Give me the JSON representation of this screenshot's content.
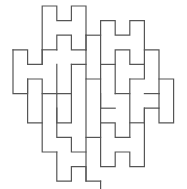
{
  "figure": {
    "stroke_color": "#555555",
    "background_color": "#ffffff",
    "stroke_width": 1.2,
    "grid": {
      "origin_x": 13,
      "origin_y": 6,
      "unit": 14.6
    },
    "paths": [
      [
        [
          2,
          4
        ],
        [
          2,
          0
        ],
        [
          3,
          0
        ],
        [
          3,
          1
        ],
        [
          4,
          1
        ],
        [
          4,
          0
        ],
        [
          5,
          0
        ],
        [
          5,
          3
        ]
      ],
      [
        [
          3,
          3
        ],
        [
          3,
          2
        ],
        [
          4,
          2
        ],
        [
          4,
          3
        ],
        [
          5,
          3
        ],
        [
          5,
          4
        ]
      ],
      [
        [
          5,
          2
        ],
        [
          6,
          2
        ]
      ],
      [
        [
          6,
          7
        ],
        [
          6,
          1
        ],
        [
          7,
          1
        ],
        [
          7,
          2
        ],
        [
          8,
          2
        ],
        [
          8,
          1
        ],
        [
          9,
          1
        ],
        [
          9,
          3
        ],
        [
          10,
          3
        ],
        [
          10,
          6
        ]
      ],
      [
        [
          6,
          4
        ],
        [
          7,
          4
        ]
      ],
      [
        [
          7,
          6
        ],
        [
          7,
          3
        ],
        [
          8,
          3
        ],
        [
          8,
          4
        ],
        [
          9,
          4
        ],
        [
          9,
          3
        ]
      ],
      [
        [
          2,
          3
        ],
        [
          3,
          3
        ]
      ],
      [
        [
          0,
          3
        ],
        [
          1,
          3
        ],
        [
          1,
          4
        ],
        [
          2,
          4
        ],
        [
          2,
          3
        ]
      ],
      [
        [
          0,
          3
        ],
        [
          0,
          6
        ],
        [
          1,
          6
        ],
        [
          1,
          5
        ],
        [
          2,
          5
        ],
        [
          2,
          6
        ],
        [
          3,
          6
        ],
        [
          3,
          4
        ]
      ],
      [
        [
          4,
          4
        ],
        [
          5,
          4
        ],
        [
          5,
          5
        ],
        [
          6,
          5
        ]
      ],
      [
        [
          4,
          4
        ],
        [
          4,
          6
        ],
        [
          3,
          6
        ]
      ],
      [
        [
          1,
          5
        ],
        [
          1,
          8
        ],
        [
          2,
          8
        ]
      ],
      [
        [
          3,
          6
        ],
        [
          3,
          9
        ],
        [
          4,
          9
        ],
        [
          4,
          10
        ],
        [
          5,
          10
        ]
      ],
      [
        [
          2,
          6
        ],
        [
          2,
          10
        ],
        [
          3,
          10
        ]
      ],
      [
        [
          4,
          6
        ],
        [
          4,
          8
        ],
        [
          3,
          8
        ],
        [
          3,
          7
        ]
      ],
      [
        [
          5,
          5
        ],
        [
          5,
          12
        ],
        [
          6,
          12
        ]
      ],
      [
        [
          5,
          9
        ],
        [
          6,
          9
        ]
      ],
      [
        [
          6,
          6
        ],
        [
          6,
          8
        ],
        [
          7,
          8
        ],
        [
          7,
          9
        ],
        [
          8,
          9
        ]
      ],
      [
        [
          7,
          6
        ],
        [
          8,
          6
        ]
      ],
      [
        [
          7,
          7
        ],
        [
          6,
          7
        ]
      ],
      [
        [
          8,
          5
        ],
        [
          9,
          5
        ],
        [
          9,
          4
        ]
      ],
      [
        [
          8,
          5
        ],
        [
          8,
          9
        ]
      ],
      [
        [
          9,
          6
        ],
        [
          10,
          6
        ]
      ],
      [
        [
          10,
          5
        ],
        [
          11,
          5
        ],
        [
          11,
          8
        ],
        [
          10,
          8
        ],
        [
          10,
          7
        ],
        [
          9,
          7
        ],
        [
          9,
          11
        ],
        [
          8,
          11
        ],
        [
          8,
          10
        ],
        [
          7,
          10
        ],
        [
          7,
          11
        ],
        [
          6,
          11
        ],
        [
          6,
          8
        ]
      ],
      [
        [
          8,
          8
        ],
        [
          9,
          8
        ]
      ],
      [
        [
          3,
          10
        ],
        [
          3,
          12
        ],
        [
          4,
          12
        ],
        [
          4,
          11
        ],
        [
          5,
          11
        ],
        [
          5,
          12
        ]
      ],
      [
        [
          6,
          12
        ],
        [
          6,
          13
        ]
      ],
      [
        [
          5,
          3
        ],
        [
          5,
          2
        ]
      ],
      [
        [
          9,
          7
        ],
        [
          9,
          8
        ]
      ],
      [
        [
          10,
          6
        ],
        [
          10,
          7
        ]
      ]
    ]
  }
}
